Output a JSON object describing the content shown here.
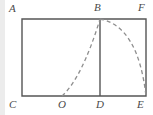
{
  "figure": {
    "type": "geometry-diagram",
    "background_color": "#ffffff",
    "margin_strip_color": "#ececec",
    "solid_line_color": "#555555",
    "dashed_line_color": "#8e8e8e",
    "label_color": "#4a4a4a",
    "labels": [
      {
        "id": "A",
        "text": "A",
        "position": "top-left",
        "x": 9,
        "y": 3
      },
      {
        "id": "B",
        "text": "B",
        "position": "top-middle",
        "x": 94,
        "y": 2
      },
      {
        "id": "F",
        "text": "F",
        "position": "top-right",
        "x": 138,
        "y": 2
      },
      {
        "id": "C",
        "text": "C",
        "position": "bottom-left",
        "x": 9,
        "y": 99
      },
      {
        "id": "O",
        "text": "O",
        "position": "bottom-mid-left",
        "x": 58,
        "y": 99
      },
      {
        "id": "D",
        "text": "D",
        "position": "bottom-middle",
        "x": 96,
        "y": 99
      },
      {
        "id": "E",
        "text": "E",
        "position": "bottom-right",
        "x": 137,
        "y": 99
      }
    ],
    "points": {
      "A": {
        "x": 22,
        "y": 19
      },
      "F": {
        "x": 146,
        "y": 19
      },
      "C": {
        "x": 22,
        "y": 96
      },
      "E": {
        "x": 146,
        "y": 96
      },
      "B": {
        "x": 100,
        "y": 19
      },
      "D": {
        "x": 100,
        "y": 96
      },
      "O": {
        "x": 62,
        "y": 96
      }
    },
    "shapes": {
      "rectangle": "A-F-E-C",
      "vertical_segment": "B-D",
      "dashed_curve": "O-B-E"
    }
  }
}
